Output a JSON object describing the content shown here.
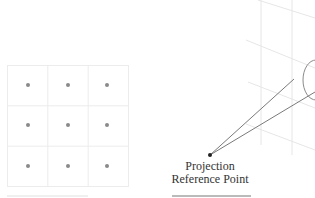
{
  "diagram": {
    "left_panel": {
      "grid": {
        "rows": 3,
        "cols": 3,
        "x": 7,
        "y": 65,
        "cell": 40.3,
        "line_color": "#ececec",
        "dot_color": "#888888"
      }
    },
    "right_panel": {
      "projection_reference_point": {
        "x": 210,
        "y": 155
      },
      "label_line1": "Projection",
      "label_line2": "Reference Point",
      "line_color": "#7a7a7a",
      "plane_line_color": "#e6e6e6"
    }
  }
}
